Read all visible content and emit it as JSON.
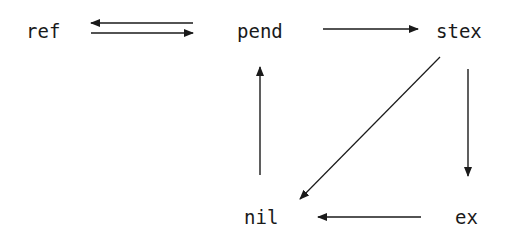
{
  "diagram": {
    "type": "state-transition",
    "nodes": [
      {
        "id": "ref",
        "label": "ref"
      },
      {
        "id": "pend",
        "label": "pend"
      },
      {
        "id": "stex",
        "label": "stex"
      },
      {
        "id": "nil",
        "label": "nil"
      },
      {
        "id": "ex",
        "label": "ex"
      }
    ],
    "edges": [
      {
        "from": "pend",
        "to": "ref"
      },
      {
        "from": "ref",
        "to": "pend"
      },
      {
        "from": "pend",
        "to": "stex"
      },
      {
        "from": "stex",
        "to": "ex"
      },
      {
        "from": "stex",
        "to": "nil"
      },
      {
        "from": "ex",
        "to": "nil"
      },
      {
        "from": "nil",
        "to": "pend"
      }
    ],
    "colors": {
      "line": "#1a1a1a",
      "text": "#1a1a1a",
      "background": "#ffffff"
    }
  }
}
